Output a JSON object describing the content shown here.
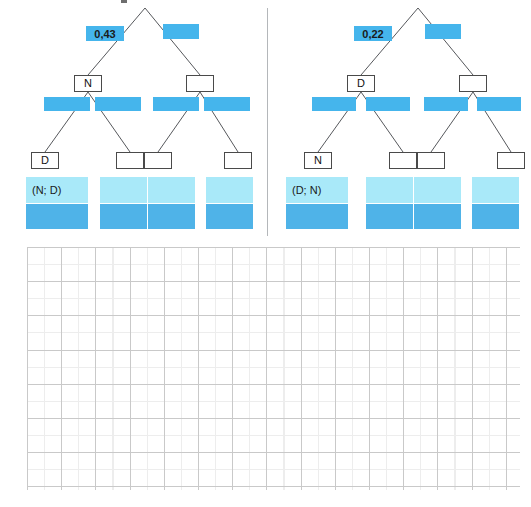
{
  "figure": {
    "type": "probability-tree-diagram-pair",
    "divider": {
      "color": "#b4b7ba"
    },
    "colors": {
      "bar_blue": "#45b5ec",
      "leaf_top_cyan": "#a9e9f9",
      "leaf_bottom_blue": "#4fb3e8",
      "node_border": "#4a4a4a",
      "branch_line": "#56585c",
      "grid_major": "#c9c9c9",
      "grid_minor": "#ededed"
    },
    "trees": [
      {
        "id": "left-tree",
        "level1": {
          "left_value": "0,43",
          "right_value": ""
        },
        "level2_nodes": [
          {
            "id": "left-tree-node-l",
            "label": "N"
          },
          {
            "id": "left-tree-node-r",
            "label": ""
          }
        ],
        "level2_bars": [
          "",
          "",
          "",
          ""
        ],
        "level3_nodes": [
          {
            "id": "left-tree-leaf-1",
            "label": "D"
          },
          {
            "id": "left-tree-leaf-2",
            "label": ""
          },
          {
            "id": "left-tree-leaf-3",
            "label": ""
          },
          {
            "id": "left-tree-leaf-4",
            "label": ""
          }
        ],
        "outcome_blocks": [
          {
            "id": "left-tree-outcome-1",
            "label": "(N; D)"
          },
          {
            "id": "left-tree-outcome-2",
            "label": ""
          },
          {
            "id": "left-tree-outcome-3",
            "label": ""
          },
          {
            "id": "left-tree-outcome-4",
            "label": ""
          }
        ]
      },
      {
        "id": "right-tree",
        "level1": {
          "left_value": "0,22",
          "right_value": ""
        },
        "level2_nodes": [
          {
            "id": "right-tree-node-l",
            "label": "D"
          },
          {
            "id": "right-tree-node-r",
            "label": ""
          }
        ],
        "level2_bars": [
          "",
          "",
          "",
          ""
        ],
        "level3_nodes": [
          {
            "id": "right-tree-leaf-1",
            "label": "N"
          },
          {
            "id": "right-tree-leaf-2",
            "label": ""
          },
          {
            "id": "right-tree-leaf-3",
            "label": ""
          },
          {
            "id": "right-tree-leaf-4",
            "label": ""
          }
        ],
        "outcome_blocks": [
          {
            "id": "right-tree-outcome-1",
            "label": "(D; N)"
          },
          {
            "id": "right-tree-outcome-2",
            "label": ""
          },
          {
            "id": "right-tree-outcome-3",
            "label": ""
          },
          {
            "id": "right-tree-outcome-4",
            "label": ""
          }
        ]
      }
    ],
    "worksheet_grid": {
      "visible": true,
      "x": 27,
      "y": 247,
      "width": 493,
      "height": 243,
      "cell_size_px": 17.1
    }
  }
}
